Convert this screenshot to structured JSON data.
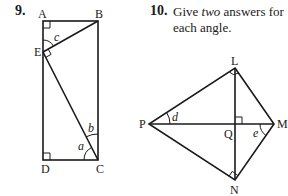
{
  "problems": [
    {
      "number": "9.",
      "figure": {
        "points": {
          "A": "A",
          "B": "B",
          "C": "C",
          "D": "D",
          "E": "E"
        },
        "angles": {
          "a": "a",
          "b": "b",
          "c": "c"
        },
        "right_angles": [
          "A",
          "D",
          "E"
        ]
      }
    },
    {
      "number": "10.",
      "text_prefix": "Give ",
      "text_emphasis": "two",
      "text_suffix": " answers for",
      "text_line2": "each angle.",
      "figure": {
        "points": {
          "L": "L",
          "M": "M",
          "N": "N",
          "P": "P",
          "Q": "Q"
        },
        "angles": {
          "d": "d",
          "e": "e"
        },
        "right_angles": [
          "L",
          "N",
          "Q"
        ]
      }
    }
  ]
}
